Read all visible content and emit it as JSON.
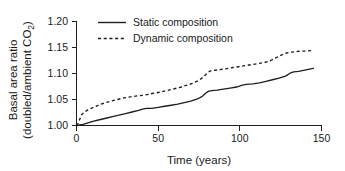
{
  "chart_data": {
    "type": "line",
    "title": "",
    "xlabel": "Time (years)",
    "ylabel_line1": "Basal area ratio",
    "ylabel_line2_prefix": "(doubled/ambient CO",
    "ylabel_line2_sub": "2",
    "ylabel_line2_suffix": ")",
    "xlim": [
      0,
      150
    ],
    "ylim": [
      1.0,
      1.2
    ],
    "xticks": [
      0,
      50,
      100,
      150
    ],
    "xtick_labels": [
      "0",
      "50",
      "100",
      "150"
    ],
    "yticks": [
      1.0,
      1.05,
      1.1,
      1.15,
      1.2
    ],
    "ytick_labels": [
      "1.00",
      "1.05",
      "1.10",
      "1.15",
      "1.20"
    ],
    "grid": false,
    "legend_position": "top-center",
    "axis_color": "#1f1f1f",
    "series": [
      {
        "name": "Static composition",
        "style": "solid",
        "color": "#1f1f1f",
        "x": [
          0,
          2,
          4,
          6,
          8,
          10,
          14,
          18,
          22,
          26,
          30,
          34,
          38,
          41,
          43,
          46,
          50,
          54,
          58,
          62,
          66,
          70,
          74,
          77,
          79,
          81,
          83,
          86,
          90,
          94,
          98,
          101,
          104,
          108,
          112,
          116,
          120,
          124,
          128,
          131,
          133,
          136,
          139,
          142,
          145
        ],
        "y": [
          1.0,
          1.001,
          1.002,
          1.004,
          1.006,
          1.008,
          1.011,
          1.014,
          1.017,
          1.02,
          1.023,
          1.026,
          1.029,
          1.032,
          1.033,
          1.033,
          1.035,
          1.037,
          1.039,
          1.041,
          1.044,
          1.047,
          1.051,
          1.056,
          1.062,
          1.066,
          1.067,
          1.068,
          1.07,
          1.072,
          1.074,
          1.077,
          1.079,
          1.08,
          1.082,
          1.085,
          1.088,
          1.091,
          1.095,
          1.101,
          1.103,
          1.104,
          1.106,
          1.108,
          1.11
        ]
      },
      {
        "name": "Dynamic composition",
        "style": "dashed",
        "color": "#1f1f1f",
        "x": [
          0,
          1,
          2,
          3,
          5,
          7,
          9,
          12,
          15,
          18,
          21,
          25,
          29,
          33,
          37,
          41,
          44,
          47,
          51,
          55,
          59,
          63,
          67,
          71,
          75,
          78,
          80,
          82,
          84,
          87,
          91,
          95,
          99,
          103,
          107,
          111,
          115,
          119,
          122,
          125,
          128,
          131,
          134,
          137,
          140,
          143,
          145
        ],
        "y": [
          1.0,
          1.004,
          1.012,
          1.02,
          1.026,
          1.03,
          1.033,
          1.037,
          1.041,
          1.044,
          1.047,
          1.05,
          1.053,
          1.055,
          1.057,
          1.058,
          1.06,
          1.062,
          1.064,
          1.067,
          1.07,
          1.073,
          1.077,
          1.081,
          1.087,
          1.094,
          1.101,
          1.105,
          1.106,
          1.107,
          1.109,
          1.111,
          1.113,
          1.115,
          1.117,
          1.119,
          1.121,
          1.125,
          1.13,
          1.135,
          1.139,
          1.141,
          1.142,
          1.143,
          1.143,
          1.144,
          1.144
        ]
      }
    ]
  },
  "legend": {
    "items": [
      {
        "label": "Static composition",
        "style": "solid"
      },
      {
        "label": "Dynamic composition",
        "style": "dashed"
      }
    ]
  }
}
